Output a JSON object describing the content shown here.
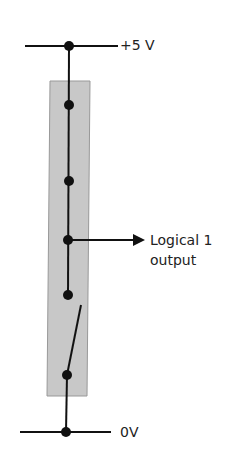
{
  "diagram": {
    "type": "circuit",
    "colors": {
      "wire": "#111111",
      "node": "#111111",
      "package_fill": "#c8c8c8",
      "package_stroke": "#999999",
      "text": "#222222"
    },
    "supply_label": "+5 V",
    "ground_label": "0V",
    "output_label_line1": "Logical 1",
    "output_label_line2": "output",
    "components": [
      {
        "name": "top-rail",
        "kind": "wire"
      },
      {
        "name": "package",
        "kind": "rectangle"
      },
      {
        "name": "node-1",
        "kind": "junction"
      },
      {
        "name": "node-2",
        "kind": "junction"
      },
      {
        "name": "output-node",
        "kind": "junction"
      },
      {
        "name": "node-4",
        "kind": "junction"
      },
      {
        "name": "switch",
        "kind": "open-switch"
      },
      {
        "name": "bottom-rail",
        "kind": "wire"
      }
    ]
  }
}
